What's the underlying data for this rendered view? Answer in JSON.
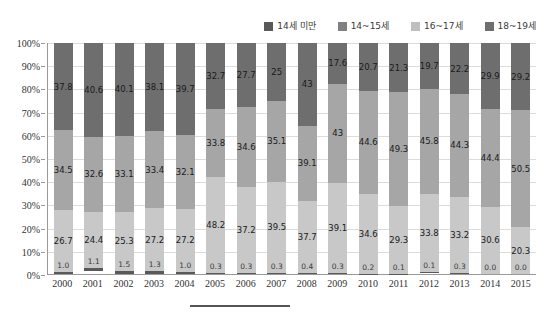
{
  "legend": {
    "items": [
      {
        "label": "14세 미만",
        "color": "#595959"
      },
      {
        "label": "14~15세",
        "color": "#808080"
      },
      {
        "label": "16~17세",
        "color": "#bfbfbf"
      },
      {
        "label": "18~19세",
        "color": "#6e6e6e"
      }
    ]
  },
  "axes": {
    "y_ticks": [
      "0%",
      "10%",
      "20%",
      "30%",
      "40%",
      "50%",
      "60%",
      "70%",
      "80%",
      "90%",
      "100%"
    ]
  },
  "chart_data": {
    "type": "bar",
    "title": "",
    "xlabel": "",
    "ylabel": "",
    "ylim": [
      0,
      100
    ],
    "stacked": true,
    "stack_total": 100,
    "grid": true,
    "legend_position": "top-right",
    "categories": [
      "2000",
      "2001",
      "2002",
      "2003",
      "2004",
      "2005",
      "2006",
      "2007",
      "2008",
      "2009",
      "2010",
      "2011",
      "2012",
      "2013",
      "2014",
      "2015"
    ],
    "series": [
      {
        "name": "14세 미만",
        "color": "#595959",
        "values": [
          1.0,
          1.1,
          1.5,
          1.3,
          1.0,
          0.3,
          0.3,
          0.3,
          0.4,
          0.3,
          0.2,
          0.1,
          0.1,
          0.3,
          0.0,
          0.0
        ],
        "labels": [
          "1.0",
          "1.1",
          "1.5",
          "1.3",
          "1.0",
          "0.3",
          "0.3",
          "0.3",
          "0.4",
          "0.3",
          "0.2",
          "0.1",
          "0.1",
          "0.3",
          "0.0",
          "0.0"
        ]
      },
      {
        "name": "14~15세",
        "color": "#c8c8c8",
        "values": [
          26.7,
          24.4,
          25.3,
          27.2,
          27.2,
          48.2,
          37.2,
          39.5,
          37.7,
          39.1,
          34.6,
          29.3,
          33.8,
          33.2,
          30.6,
          20.3
        ],
        "labels": [
          "26.7",
          "24.4",
          "25.3",
          "27.2",
          "27.2",
          "48.2",
          "37.2",
          "39.5",
          "37.7",
          "39.1",
          "34.6",
          "29.3",
          "33.8",
          "33.2",
          "30.6",
          "20.3"
        ]
      },
      {
        "name": "16~17세",
        "color": "#a6a6a6",
        "values": [
          34.5,
          32.6,
          33.1,
          33.4,
          32.1,
          33.8,
          34.6,
          35.1,
          39.1,
          43.0,
          44.6,
          49.3,
          45.8,
          44.3,
          44.4,
          50.5
        ],
        "labels": [
          "34.5",
          "32.6",
          "33.1",
          "33.4",
          "32.1",
          "33.8",
          "34.6",
          "35.1",
          "39.1",
          "43",
          "44.6",
          "49.3",
          "45.8",
          "44.3",
          "44.4",
          "50.5"
        ]
      },
      {
        "name": "18~19세",
        "color": "#6e6e6e",
        "values": [
          37.8,
          40.6,
          40.1,
          38.1,
          39.7,
          32.7,
          27.7,
          25.0,
          43.0,
          17.6,
          20.7,
          21.3,
          19.7,
          22.2,
          29.9,
          29.2
        ],
        "labels": [
          "37.8",
          "40.6",
          "40.1",
          "38.1",
          "39.7",
          "32.7",
          "27.7",
          "25",
          "43",
          "17.6",
          "20.7",
          "21.3",
          "19.7",
          "22.2",
          "29.9",
          "29.2"
        ]
      }
    ]
  }
}
